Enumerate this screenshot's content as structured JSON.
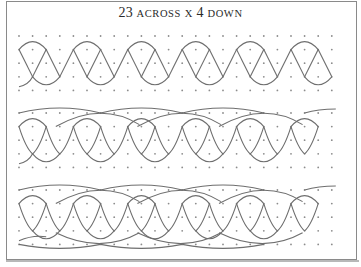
{
  "title": {
    "num_across": "23",
    "word_across": "ACROSS",
    "times": "X",
    "num_down": "4",
    "word_down": "DOWN"
  },
  "colors": {
    "frame": "#8a8a8a",
    "line": "#6e6e6e",
    "dot": "#8c8c8c",
    "text": "#2a2a2a"
  },
  "grid": {
    "columns": 24,
    "rows": 5,
    "x0": 19,
    "spacing": 13.6,
    "band_tops": [
      36,
      113,
      190
    ]
  },
  "bands": [
    {
      "name": "band-1",
      "style": "zigzag-arcs",
      "long_top_arcs": false,
      "long_bottom_arcs": false
    },
    {
      "name": "band-2",
      "style": "crossing-arcs",
      "long_top_arcs": true,
      "long_bottom_arcs": false
    },
    {
      "name": "band-3",
      "style": "crossing-arcs",
      "long_top_arcs": true,
      "long_bottom_arcs": true
    }
  ]
}
